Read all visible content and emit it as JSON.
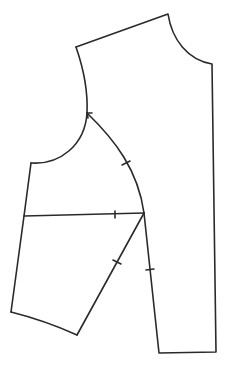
{
  "diagram": {
    "type": "sewing-pattern",
    "stroke_color": "#2a2a2a",
    "background": "#ffffff",
    "stroke_width": 1.6,
    "paths": {
      "bodice_outline": "M76,47 L168,14 C172,40 188,60 212,64 L216,352 L159,353 L144,213",
      "armhole_upper": "M76,47 C84,70 88,92 87,113",
      "armhole_lower": "M87,113 C85,145 60,165 31,163",
      "left_side": "M31,163 L24,216 L11,312",
      "hem_curve": "M11,312 C35,318 55,325 77,335",
      "slant_seam": "M77,335 L144,213",
      "sleeve_cap_arc": "M87,113 C115,140 138,170 144,213",
      "bicep_line": "M24,216 L144,213"
    },
    "notches": [
      {
        "name": "armhole-arc-notch",
        "x1": 122,
        "y1": 165,
        "x2": 130,
        "y2": 161
      },
      {
        "name": "bicep-line-notch",
        "x1": 115,
        "y1": 211,
        "x2": 115,
        "y2": 218
      },
      {
        "name": "slant-seam-notch",
        "x1": 113,
        "y1": 260,
        "x2": 121,
        "y2": 264
      },
      {
        "name": "side-seam-notch",
        "x1": 146,
        "y1": 270,
        "x2": 154,
        "y2": 269
      }
    ],
    "arrow": {
      "tip_x": 87,
      "tip_y": 113,
      "points": "92,113 87,113 88,118"
    }
  }
}
